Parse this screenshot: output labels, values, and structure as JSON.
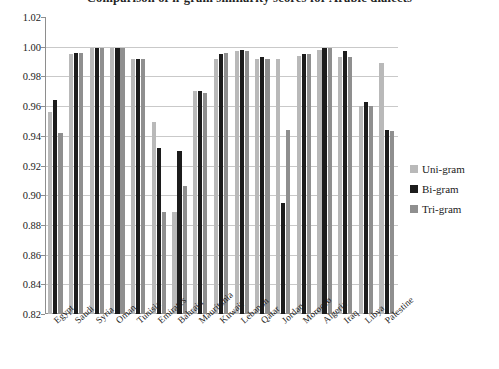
{
  "chart_data": {
    "type": "bar",
    "title": "Comparison of n-gram similarity scores for Arabic dialects",
    "xlabel": "",
    "ylabel": "",
    "ylim": [
      0.82,
      1.02
    ],
    "ytick_step": 0.02,
    "ytick_labels": [
      "1.02",
      "1.00",
      "0.98",
      "0.96",
      "0.94",
      "0.92",
      "0.90",
      "0.88",
      "0.86",
      "0.84",
      "0.82"
    ],
    "ytick_values": [
      1.02,
      1.0,
      0.98,
      0.96,
      0.94,
      0.92,
      0.9,
      0.88,
      0.86,
      0.84,
      0.82
    ],
    "grid": true,
    "legend_position": "right",
    "categories": [
      "Egypt",
      "Saudi",
      "Syria",
      "Oman",
      "Tunisia",
      "Emirates",
      "Bahrain",
      "Mauritania",
      "Kuwait",
      "Lebanon",
      "Qatar",
      "Jordan",
      "Morocco",
      "Algeria",
      "Iraq",
      "Libya",
      "Palestine"
    ],
    "series": [
      {
        "name": "Uni-gram",
        "color": "#b9b9b9",
        "values": [
          0.956,
          0.995,
          0.999,
          0.999,
          0.992,
          0.949,
          0.889,
          0.97,
          0.992,
          0.997,
          0.992,
          0.992,
          0.994,
          0.998,
          0.993,
          0.96,
          0.989
        ]
      },
      {
        "name": "Bi-gram",
        "color": "#1c1c1c",
        "values": [
          0.964,
          0.996,
          0.999,
          0.999,
          0.992,
          0.932,
          0.93,
          0.97,
          0.995,
          0.998,
          0.993,
          0.895,
          0.995,
          0.999,
          0.997,
          0.963,
          0.944
        ]
      },
      {
        "name": "Tri-gram",
        "color": "#8f8f8f",
        "values": [
          0.942,
          0.996,
          0.999,
          0.999,
          0.992,
          0.889,
          0.906,
          0.969,
          0.996,
          0.997,
          0.992,
          0.944,
          0.995,
          0.999,
          0.993,
          0.96,
          0.943
        ]
      }
    ]
  },
  "legend": {
    "items": [
      {
        "label": "Uni-gram",
        "color": "#b9b9b9"
      },
      {
        "label": "Bi-gram",
        "color": "#1c1c1c"
      },
      {
        "label": "Tri-gram",
        "color": "#8f8f8f"
      }
    ]
  }
}
